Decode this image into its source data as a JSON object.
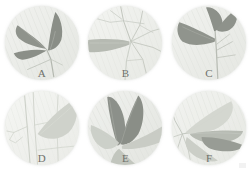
{
  "plate": {
    "title": "Leaf specimen plate",
    "background_color": "#ffffff",
    "corner_mark": "faint-gray-mark",
    "panels": [
      {
        "id": "a",
        "label": "A",
        "disc_color": "#eceeea",
        "description": "Three narrow lanceolate leaves radiating from a lower-right node; two dark blades point upper-left and left, one dark blade points up.",
        "leaf_count": 3,
        "dark_leaf_color": "#8f938c",
        "pale_leaf_color": "#d6d9d2",
        "vein_color": "#b9bdb5"
      },
      {
        "id": "b",
        "label": "B",
        "disc_color": "#eeefec",
        "description": "Single pale horizontal blade on the left with a branching network of fine stems spreading right.",
        "leaf_count": 1,
        "dark_leaf_color": "#b6bab2",
        "pale_leaf_color": "#d9dcd5",
        "vein_color": "#c3c7bf"
      },
      {
        "id": "c",
        "label": "C",
        "disc_color": "#ecedea",
        "description": "One broad dark blade angled down-left plus two smaller dark blades at upper right, joined at a central vertical stem.",
        "leaf_count": 3,
        "dark_leaf_color": "#90948d",
        "pale_leaf_color": "#d5d8d1",
        "vein_color": "#bcc0b8"
      },
      {
        "id": "d",
        "label": "D",
        "disc_color": "#eff0ed",
        "description": "Very pale single broad blade in the upper right with thin vertical stems crossing the lower left.",
        "leaf_count": 1,
        "dark_leaf_color": "#cfd2cb",
        "pale_leaf_color": "#e2e4df",
        "vein_color": "#cdd1c9"
      },
      {
        "id": "e",
        "label": "E",
        "disc_color": "#ebece9",
        "description": "Fan of five blades radiating from a node at lower-left centre; two dark blades point up, pale blades spread right and down.",
        "leaf_count": 5,
        "dark_leaf_color": "#8d918a",
        "pale_leaf_color": "#d4d7d0",
        "vein_color": "#bbbfb7"
      },
      {
        "id": "f",
        "label": "F",
        "disc_color": "#edeeeb",
        "description": "Several blades radiating from a node at the left edge; one dark blade sweeps to the right, pale blades above and below.",
        "leaf_count": 4,
        "dark_leaf_color": "#989c95",
        "pale_leaf_color": "#d7dad3",
        "vein_color": "#c0c4bc"
      }
    ]
  }
}
